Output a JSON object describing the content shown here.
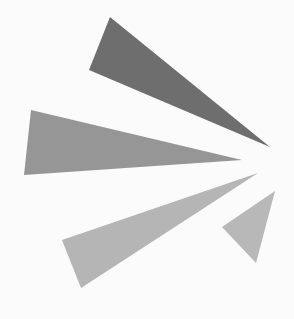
{
  "background": "#fbfbfb",
  "logo": {
    "description": "burst of four gray triangular rays converging toward a point at the right",
    "rays": [
      {
        "name": "ray-top",
        "color": "#6e6e6e",
        "points": "110,17 89,70 270,147"
      },
      {
        "name": "ray-middle",
        "color": "#969696",
        "points": "31,110 24,175 242,160"
      },
      {
        "name": "ray-lower",
        "color": "#b5b5b5",
        "points": "62,240 81,288 258,173"
      },
      {
        "name": "ray-small",
        "color": "#b8b8b8",
        "points": "275,191 222,227 256,263"
      }
    ]
  }
}
